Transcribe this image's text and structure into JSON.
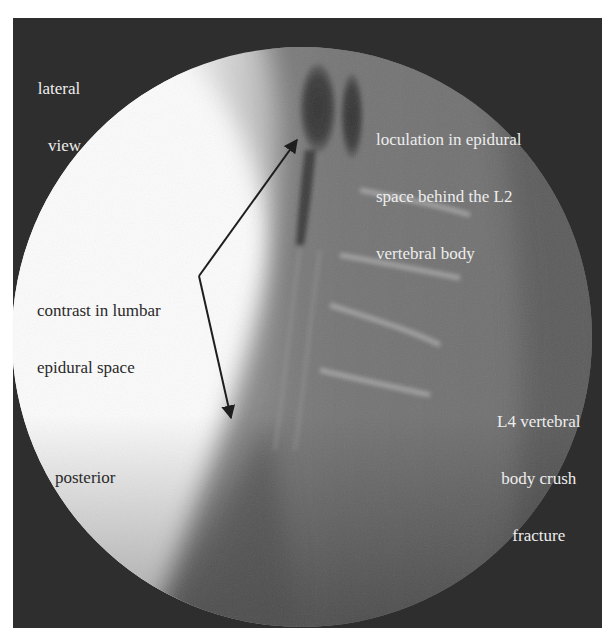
{
  "figure": {
    "kind": "lateral lumbar spine fluoroscopy radiograph",
    "colors": {
      "frame": "#2e2e2e",
      "page_background": "#ffffff",
      "soft_tissue_white": "#fbfbfb",
      "spine_grey": "#6e6e6e",
      "contrast_dark": "#3a3a3a",
      "label_light": "#ededed",
      "label_dark": "#2a2a2a",
      "arrow": "#1e1e1e"
    }
  },
  "labels": {
    "view": {
      "lines": [
        "lateral",
        "view"
      ]
    },
    "loculation": {
      "lines": [
        "loculation in epidural",
        "space behind the L2",
        "vertebral body"
      ]
    },
    "contrast": {
      "lines": [
        "contrast in lumbar",
        "epidural space"
      ]
    },
    "fracture": {
      "lines": [
        "L4 vertebral",
        "body crush",
        "fracture"
      ]
    },
    "posterior": {
      "lines": [
        "posterior"
      ]
    }
  },
  "arrows": [
    {
      "name": "arrow-to-loculation",
      "from": [
        199,
        276
      ],
      "to": [
        297,
        140
      ]
    },
    {
      "name": "arrow-to-lumbar-epidural",
      "from": [
        199,
        276
      ],
      "to": [
        231,
        418
      ]
    }
  ]
}
